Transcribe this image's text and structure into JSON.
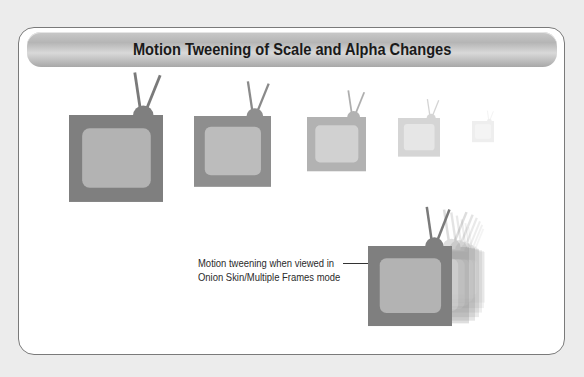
{
  "title": "Motion Tweening of Scale and Alpha Changes",
  "caption": {
    "line1": "Motion tweening when viewed in",
    "line2": "Onion Skin/Multiple Frames mode"
  },
  "colors": {
    "background": "#ececec",
    "card": "#ffffff",
    "tv_body": "#7f7f7f",
    "tv_screen": "#b3b3b3",
    "header_bar": "#b8b8b8"
  },
  "tween_frames": [
    {
      "label": "frame-1",
      "x": 69,
      "y": 115,
      "w": 94,
      "h": 87,
      "opacity": 1.0
    },
    {
      "label": "frame-2",
      "x": 194,
      "y": 116,
      "w": 77,
      "h": 71,
      "opacity": 0.85
    },
    {
      "label": "frame-3",
      "x": 307,
      "y": 117,
      "w": 59,
      "h": 54,
      "opacity": 0.55
    },
    {
      "label": "frame-4",
      "x": 398,
      "y": 118,
      "w": 42,
      "h": 39,
      "opacity": 0.3
    },
    {
      "label": "frame-5",
      "x": 472,
      "y": 121,
      "w": 22,
      "h": 21,
      "opacity": 0.12
    }
  ],
  "onion_skin": {
    "main": {
      "x": 368,
      "y": 246,
      "w": 84,
      "h": 80
    },
    "ghost_count": 6
  }
}
